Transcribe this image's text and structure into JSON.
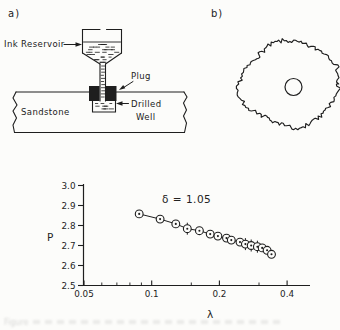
{
  "figure": {
    "panel_a": {
      "label": "a)",
      "ink_reservoir_label": "Ink Reservoir",
      "plug_label": "Plug",
      "drilled_label": "Drilled",
      "well_label": "Well",
      "sandstone_label": "Sandstone"
    },
    "panel_b": {
      "label": "b)"
    },
    "caption_fragment": "Figure"
  },
  "chart_data": {
    "type": "scatter",
    "x_scale": "log",
    "title": "",
    "xlabel": "λ",
    "ylabel": "P",
    "annotation": "δ = 1.05",
    "xlim": [
      0.05,
      0.4
    ],
    "ylim": [
      2.5,
      3.0
    ],
    "x_ticks": [
      0.05,
      0.1,
      0.2,
      0.4
    ],
    "x_tick_labels": [
      "0.05",
      "0.1",
      "0.2",
      "0.4"
    ],
    "x_minor_ticks": [
      0.06,
      0.07,
      0.08,
      0.09,
      0.15,
      0.3
    ],
    "y_ticks": [
      3.0,
      2.9,
      2.8,
      2.7,
      2.6,
      2.5
    ],
    "y_tick_labels": [
      "3.0",
      "2.9",
      "2.8",
      "2.7",
      "2.6",
      "2.5"
    ],
    "legend": "none",
    "grid": false,
    "marker": "circled-dot",
    "points": [
      {
        "lambda": 0.088,
        "P": 2.858,
        "err": false
      },
      {
        "lambda": 0.109,
        "P": 2.832,
        "err": false
      },
      {
        "lambda": 0.128,
        "P": 2.808,
        "err": false
      },
      {
        "lambda": 0.144,
        "P": 2.784,
        "err": true
      },
      {
        "lambda": 0.163,
        "P": 2.774,
        "err": false
      },
      {
        "lambda": 0.182,
        "P": 2.757,
        "err": false
      },
      {
        "lambda": 0.197,
        "P": 2.747,
        "err": false
      },
      {
        "lambda": 0.215,
        "P": 2.737,
        "err": false
      },
      {
        "lambda": 0.226,
        "P": 2.727,
        "err": false
      },
      {
        "lambda": 0.247,
        "P": 2.717,
        "err": false
      },
      {
        "lambda": 0.261,
        "P": 2.707,
        "err": true
      },
      {
        "lambda": 0.277,
        "P": 2.7,
        "err": true
      },
      {
        "lambda": 0.295,
        "P": 2.694,
        "err": true
      },
      {
        "lambda": 0.31,
        "P": 2.688,
        "err": false
      },
      {
        "lambda": 0.326,
        "P": 2.676,
        "err": false
      },
      {
        "lambda": 0.341,
        "P": 2.656,
        "err": false
      }
    ]
  },
  "colors": {
    "ink": "#1e1e1e",
    "paper": "#fcfcfa"
  }
}
